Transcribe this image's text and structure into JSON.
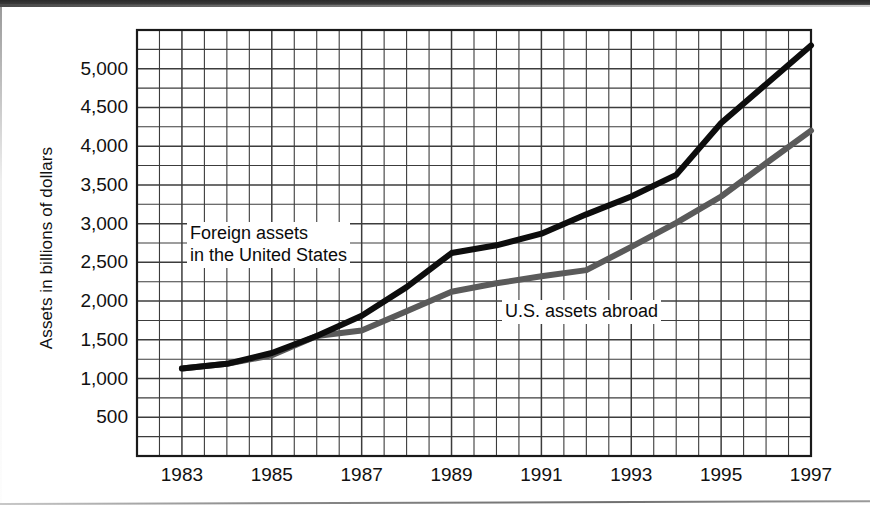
{
  "figure": {
    "background_color": "#ffffff",
    "axis_color": "#1a1a1a",
    "grid_color": "#3c3c3c"
  },
  "chart_data": {
    "type": "line",
    "title": "",
    "subtitle": "",
    "xlabel": "",
    "ylabel": "Assets in billions of dollars",
    "xlim": [
      1982,
      1997
    ],
    "ylim": [
      0,
      5500
    ],
    "grid": true,
    "grid_minor": true,
    "legend_position": "inline-annotations",
    "x_tick_labels": [
      "1983",
      "1985",
      "1987",
      "1989",
      "1991",
      "1993",
      "1995",
      "1997"
    ],
    "x_tick_values": [
      1983,
      1985,
      1987,
      1989,
      1991,
      1993,
      1995,
      1997
    ],
    "y_tick_labels": [
      "500",
      "1,000",
      "1,500",
      "2,000",
      "2,500",
      "3,000",
      "3,500",
      "4,000",
      "4,500",
      "5,000"
    ],
    "y_tick_values": [
      500,
      1000,
      1500,
      2000,
      2500,
      3000,
      3500,
      4000,
      4500,
      5000
    ],
    "x": [
      1983,
      1984,
      1985,
      1986,
      1987,
      1988,
      1989,
      1990,
      1991,
      1992,
      1993,
      1994,
      1995,
      1996,
      1997
    ],
    "series": [
      {
        "name": "Foreign assets in the United States",
        "color": "#0d0d0d",
        "line_width": 6,
        "values": [
          1130,
          1190,
          1330,
          1550,
          1810,
          2180,
          2620,
          2720,
          2870,
          3120,
          3350,
          3630,
          4300,
          4800,
          5300
        ]
      },
      {
        "name": "U.S. assets abroad",
        "color": "#5a5a5a",
        "line_width": 6,
        "values": [
          1130,
          1190,
          1300,
          1550,
          1620,
          1870,
          2120,
          2230,
          2320,
          2400,
          2700,
          3010,
          3350,
          3780,
          4200
        ]
      }
    ],
    "annotations": [
      {
        "id": "foreign",
        "text_line_1": "Foreign assets",
        "text_line_2": "in the United States",
        "x": 1983.5,
        "y": 2720
      },
      {
        "id": "usabroad",
        "text_line_1": "U.S. assets abroad",
        "text_line_2": "",
        "x": 1990.1,
        "y": 1900
      }
    ]
  }
}
